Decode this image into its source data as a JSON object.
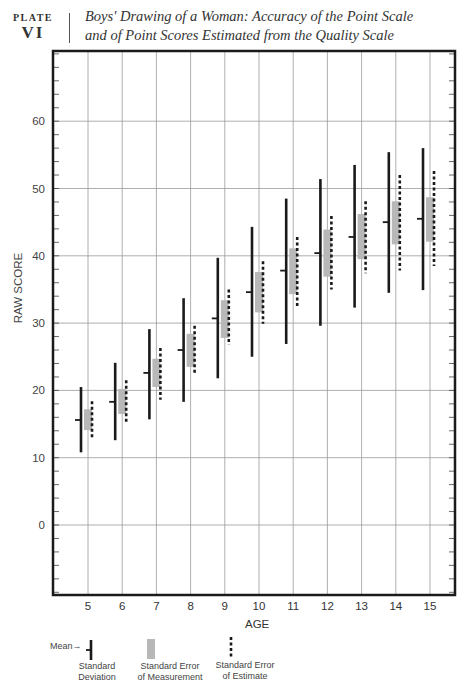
{
  "header": {
    "plate_word": "PLATE",
    "plate_number": "VI",
    "title_line1": "Boys' Drawing of a Woman: Accuracy of the Point Scale",
    "title_line2": "and of Point Scores Estimated from the Quality Scale"
  },
  "legend": {
    "mean_label": "Mean→",
    "sd_label_1": "Standard",
    "sd_label_2": "Deviation",
    "sem_label_1": "Standard Error",
    "sem_label_2": "of Measurement",
    "see_label_1": "Standard Error",
    "see_label_2": "of Estimate"
  },
  "colors": {
    "sd": "#1a1a1a",
    "sem": "#b8b8b8",
    "see": "#1a1a1a",
    "grid": "#9a9a9a",
    "frame": "#1a1a1a"
  },
  "chart_data": {
    "type": "errorbar",
    "title": "Boys' Drawing of a Woman: Accuracy of the Point Scale and of Point Scores Estimated from the Quality Scale",
    "xlabel": "AGE",
    "ylabel": "RAW SCORE",
    "categories": [
      5,
      6,
      7,
      8,
      9,
      10,
      11,
      12,
      13,
      14,
      15
    ],
    "ylim": [
      -10,
      70
    ],
    "yticks": [
      0,
      10,
      20,
      30,
      40,
      50,
      60
    ],
    "grid": true,
    "series": [
      {
        "name": "Mean",
        "values": [
          15.6,
          18.3,
          22.6,
          26.0,
          30.7,
          34.6,
          37.8,
          40.4,
          42.8,
          45.0,
          45.5
        ]
      },
      {
        "name": "Standard Deviation (high)",
        "values": [
          20.5,
          24.1,
          29.1,
          33.7,
          39.7,
          44.3,
          48.5,
          51.4,
          53.5,
          55.4,
          56.0
        ]
      },
      {
        "name": "Standard Deviation (low)",
        "values": [
          10.8,
          12.6,
          15.7,
          18.3,
          21.8,
          25.0,
          26.9,
          29.6,
          32.3,
          34.5,
          34.9
        ]
      },
      {
        "name": "Standard Error of Measurement (high)",
        "values": [
          17.2,
          20.2,
          24.7,
          28.4,
          33.4,
          37.6,
          41.1,
          43.9,
          46.2,
          48.1,
          48.7
        ]
      },
      {
        "name": "Standard Error of Measurement (low)",
        "values": [
          14.1,
          16.5,
          20.5,
          23.5,
          27.8,
          31.6,
          34.3,
          36.9,
          39.5,
          41.7,
          42.1
        ]
      },
      {
        "name": "Standard Error of Estimate (high)",
        "values": [
          18.4,
          21.5,
          26.3,
          29.6,
          35.0,
          39.2,
          42.8,
          45.9,
          48.1,
          52.0,
          52.6
        ]
      },
      {
        "name": "Standard Error of Estimate (low)",
        "values": [
          12.8,
          15.2,
          18.6,
          22.6,
          26.8,
          29.9,
          32.5,
          35.0,
          37.4,
          37.8,
          38.5
        ]
      }
    ],
    "legend": [
      "Mean",
      "Standard Deviation",
      "Standard Error of Measurement",
      "Standard Error of Estimate"
    ],
    "legend_position": "bottom-left"
  }
}
